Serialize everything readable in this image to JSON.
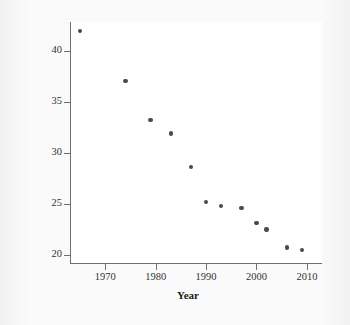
{
  "chart_data": {
    "type": "scatter",
    "title": "",
    "subtitle": "",
    "xlabel": "Year",
    "ylabel": "Percent of adults smoking",
    "xlim": [
      1963,
      2013
    ],
    "ylim": [
      19.2,
      42.8
    ],
    "grid": false,
    "legend": null,
    "legend_position": "none",
    "x_ticks": [
      1970,
      1980,
      1990,
      2000,
      2010
    ],
    "x_tick_labels": [
      "1970",
      "1980",
      "1990",
      "2000",
      "2010"
    ],
    "y_ticks": [
      20,
      25,
      30,
      35,
      40
    ],
    "y_tick_labels": [
      "20",
      "25",
      "30",
      "35",
      "40"
    ],
    "marker_color": "#4a4a4a",
    "marker_shape": "circle",
    "points": [
      {
        "x": 1965,
        "y": 41.9
      },
      {
        "x": 1974,
        "y": 37.0
      },
      {
        "x": 1979,
        "y": 33.2
      },
      {
        "x": 1983,
        "y": 31.9
      },
      {
        "x": 1987,
        "y": 28.6
      },
      {
        "x": 1990,
        "y": 25.2
      },
      {
        "x": 1993,
        "y": 24.8
      },
      {
        "x": 1997,
        "y": 24.6
      },
      {
        "x": 2000,
        "y": 23.1
      },
      {
        "x": 2002,
        "y": 22.5
      },
      {
        "x": 2006,
        "y": 20.7
      },
      {
        "x": 2009,
        "y": 20.5
      }
    ]
  },
  "colors": {
    "marker": "#4a4a4a",
    "axis": "#6f6f6f",
    "text": "#1b1b1b",
    "tick_text": "#333333",
    "plot_background": "#ffffff",
    "page_background": "#f8f8f8"
  }
}
